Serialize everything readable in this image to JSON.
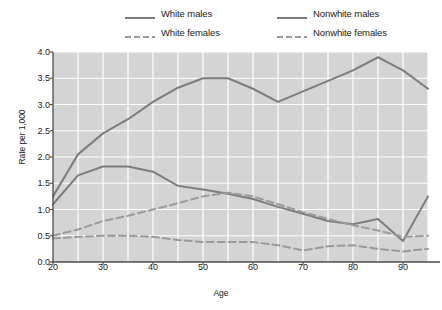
{
  "legend": {
    "entries": [
      {
        "label": "White males",
        "style": "solid",
        "color": "#7d7d7d"
      },
      {
        "label": "Nonwhite males",
        "style": "solid",
        "color": "#7d7d7d"
      },
      {
        "label": "White females",
        "style": "dashed",
        "color": "#9a9a9a"
      },
      {
        "label": "Nonwhite females",
        "style": "dashed",
        "color": "#9a9a9a"
      }
    ]
  },
  "chart_data": {
    "type": "line",
    "title": "",
    "xlabel": "Age",
    "ylabel": "Rate per 1,000",
    "xlim": [
      20,
      95
    ],
    "ylim": [
      0.0,
      4.0
    ],
    "xticks": [
      20,
      30,
      40,
      50,
      60,
      70,
      80,
      90
    ],
    "xtick_labels": [
      "20",
      "30",
      "40",
      "50",
      "60",
      "70",
      "80",
      "90"
    ],
    "yticks": [
      0.0,
      0.5,
      1.0,
      1.5,
      2.0,
      2.5,
      3.0,
      3.5,
      4.0
    ],
    "ytick_labels": [
      "0.0",
      "0.5",
      "1.0",
      "1.5",
      "2.0",
      "2.5",
      "3.0",
      "3.5",
      "4.0"
    ],
    "grid": true,
    "grid_color": "#ffffff",
    "plot_background": "#d4d4d4",
    "legend_position": "above",
    "x": [
      20,
      25,
      30,
      35,
      40,
      45,
      50,
      55,
      60,
      65,
      70,
      75,
      80,
      85,
      90,
      95
    ],
    "series": [
      {
        "name": "Nonwhite males",
        "style": "solid",
        "color": "#7d7d7d",
        "values": [
          1.25,
          2.05,
          2.45,
          2.72,
          3.05,
          3.32,
          3.5,
          3.5,
          3.3,
          3.05,
          3.25,
          3.45,
          3.65,
          3.9,
          3.65,
          3.3
        ]
      },
      {
        "name": "White males",
        "style": "solid",
        "color": "#7d7d7d",
        "values": [
          1.1,
          1.65,
          1.82,
          1.82,
          1.72,
          1.45,
          1.38,
          1.3,
          1.2,
          1.05,
          0.92,
          0.78,
          0.72,
          0.82,
          0.4,
          1.25
        ]
      },
      {
        "name": "Nonwhite females",
        "style": "dashed",
        "color": "#9a9a9a",
        "values": [
          0.5,
          0.62,
          0.78,
          0.88,
          1.0,
          1.12,
          1.25,
          1.32,
          1.25,
          1.1,
          0.95,
          0.82,
          0.7,
          0.6,
          0.48,
          0.5
        ]
      },
      {
        "name": "White females",
        "style": "dashed",
        "color": "#9a9a9a",
        "values": [
          0.45,
          0.48,
          0.5,
          0.5,
          0.48,
          0.42,
          0.38,
          0.38,
          0.38,
          0.32,
          0.22,
          0.3,
          0.32,
          0.25,
          0.2,
          0.25
        ]
      }
    ]
  }
}
